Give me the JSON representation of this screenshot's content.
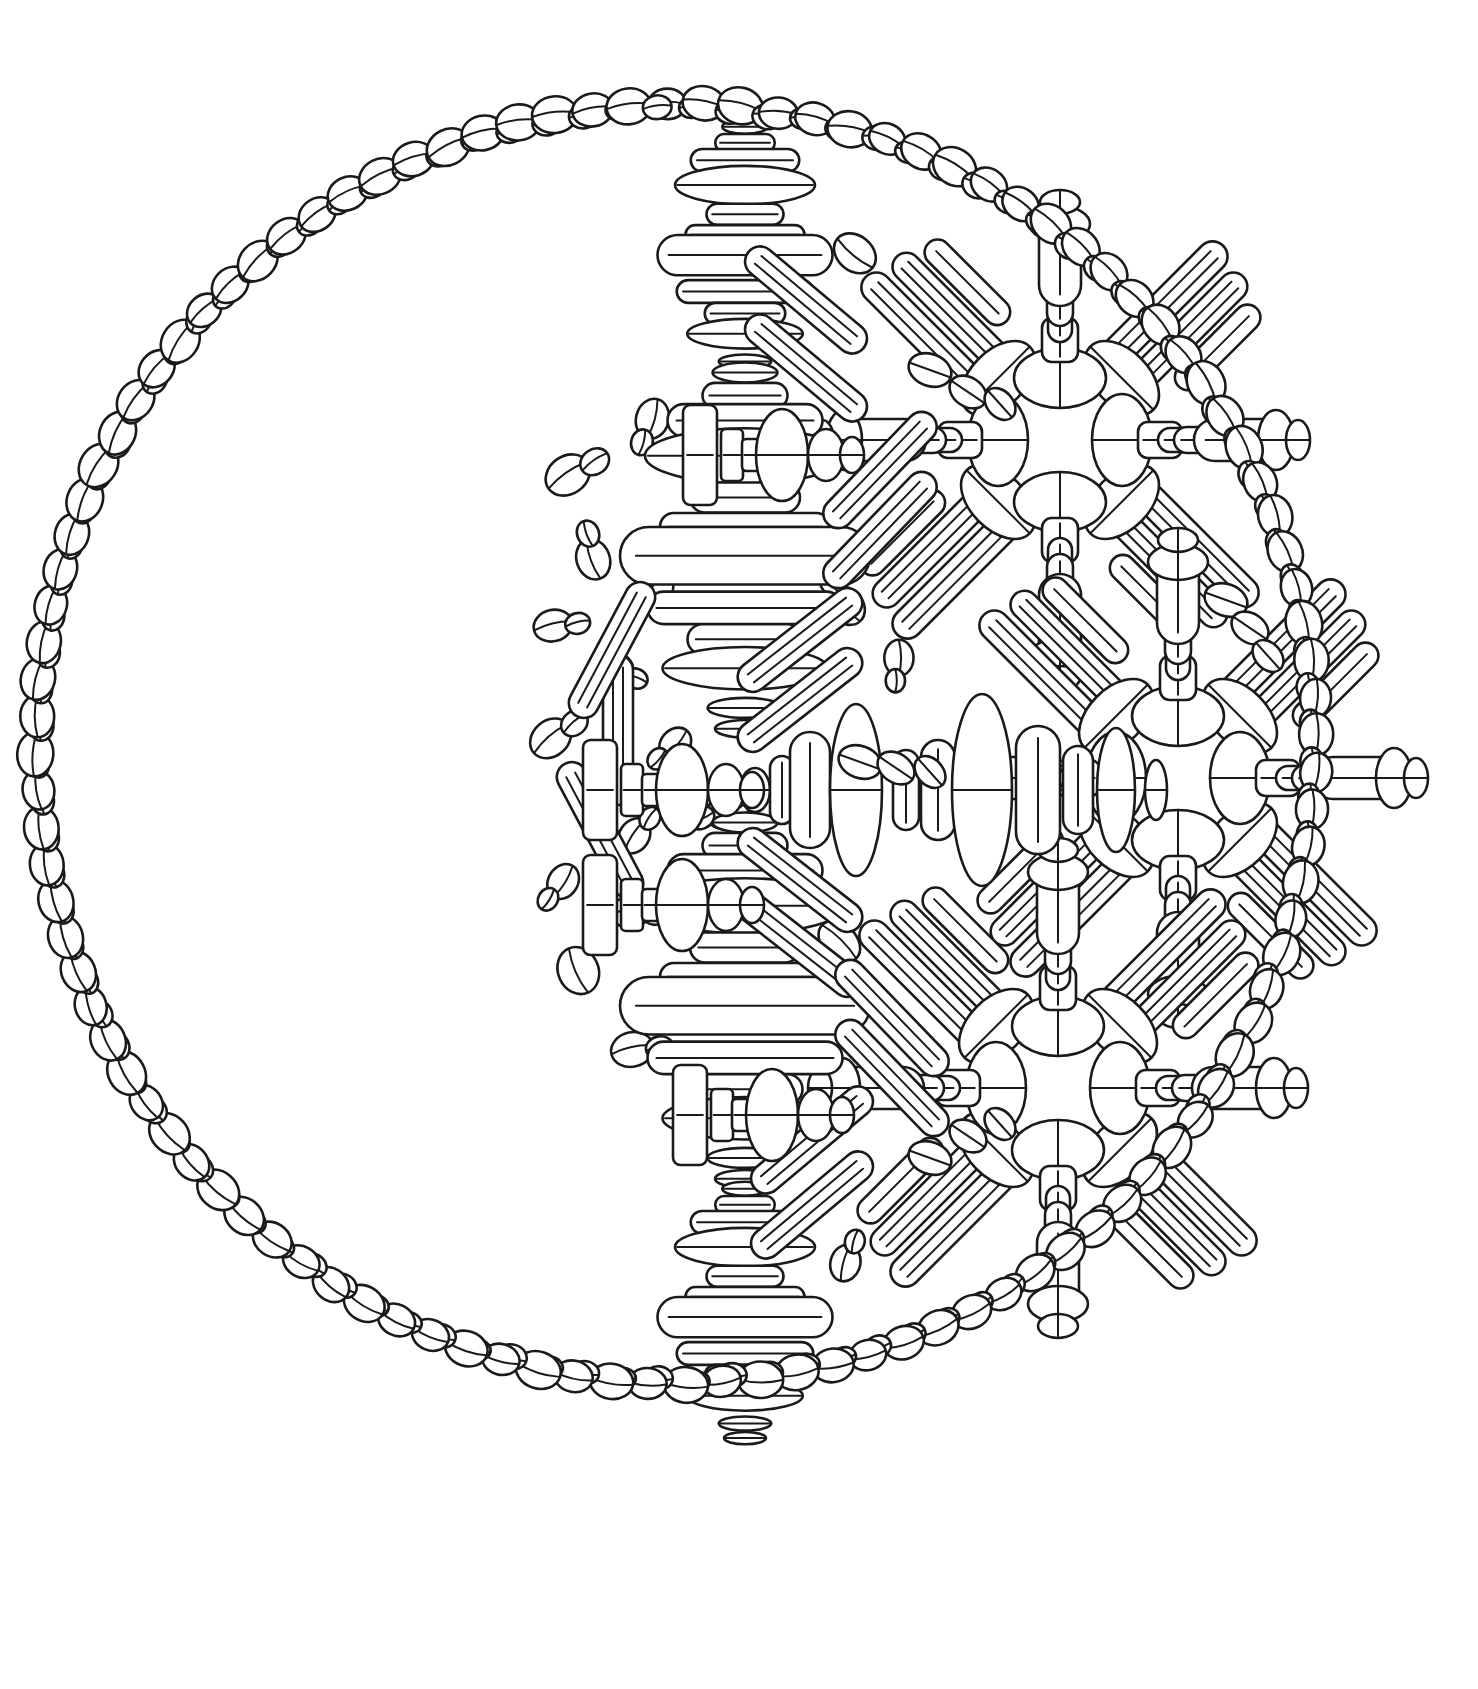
{
  "artwork": {
    "title": "Coffee Bean Mandala",
    "subtitle": "Line-art coloring page",
    "medium": "black ink line drawing on white paper",
    "background_color": "#ffffff",
    "ink_color": "#1a1a1a",
    "canvas": {
      "width": 1478,
      "height": 1689
    }
  },
  "composition": {
    "outer_ring": {
      "name": "coffee-bean-circle-border",
      "center_x": 676,
      "center_y": 744,
      "radius": 640,
      "bead_count": 108,
      "bead_motif": "large-bean-plus-small-bean-pair",
      "description": "A complete circle outlined by pairs of coffee beans, each pair a large split-ellipse bean with a smaller bean tucked beside it."
    },
    "interior_void": {
      "name": "crescent-empty-area",
      "description": "Left-hand crescent of the circle is left blank white paper; all pattern is massed in the right two-thirds.",
      "fill_boundary_center_x": 1060,
      "fill_boundary_radius": 560
    },
    "rosettes": [
      {
        "name": "rosette-upper-right",
        "cx": 1060,
        "cy": 440,
        "radius": 190,
        "arms": 8
      },
      {
        "name": "rosette-center-right",
        "cx": 1178,
        "cy": 778,
        "radius": 190,
        "arms": 8
      },
      {
        "name": "rosette-lower-right",
        "cx": 1058,
        "cy": 1088,
        "radius": 190,
        "arms": 8
      }
    ],
    "totems": [
      {
        "name": "totem-upper-left-spine",
        "cx": 745,
        "cy": 258,
        "height": 210,
        "orientation": "vertical"
      },
      {
        "name": "totem-mid-left-spine",
        "cx": 745,
        "cy": 560,
        "height": 300,
        "orientation": "vertical"
      },
      {
        "name": "totem-lower-left-spine",
        "cx": 745,
        "cy": 1010,
        "height": 300,
        "orientation": "vertical"
      },
      {
        "name": "totem-bottom-spine",
        "cx": 745,
        "cy": 1320,
        "height": 210,
        "orientation": "vertical"
      },
      {
        "name": "totem-horizontal-center",
        "cx": 960,
        "cy": 790,
        "width": 420,
        "orientation": "horizontal"
      }
    ],
    "scatter_field": {
      "name": "loose-bean-scatter",
      "bean_count": 58,
      "description": "Single and paired coffee beans scattered at varied angles filling the gaps between the rosettes and the outer ring on the right side."
    }
  },
  "shape_glossary": [
    {
      "id": "bean",
      "label": "coffee bean",
      "description": "ellipse with a single centre crease line"
    },
    {
      "id": "bean-pair",
      "label": "coffee bean pair",
      "description": "one large bean with a smaller bean overlapping it"
    },
    {
      "id": "capsule",
      "label": "capsule bar",
      "description": "elongated rounded rectangle ruled with parallel lines"
    },
    {
      "id": "disc-stack",
      "label": "stacked discs",
      "description": "graduated stack of flattened bean discs forming a totem"
    },
    {
      "id": "spool",
      "label": "spool",
      "description": "wide flat slab narrowing to a waist then flaring again"
    }
  ],
  "palette": {
    "paper": "#ffffff",
    "ink": "#1a1a1a",
    "shape_fill": "#ffffff"
  }
}
